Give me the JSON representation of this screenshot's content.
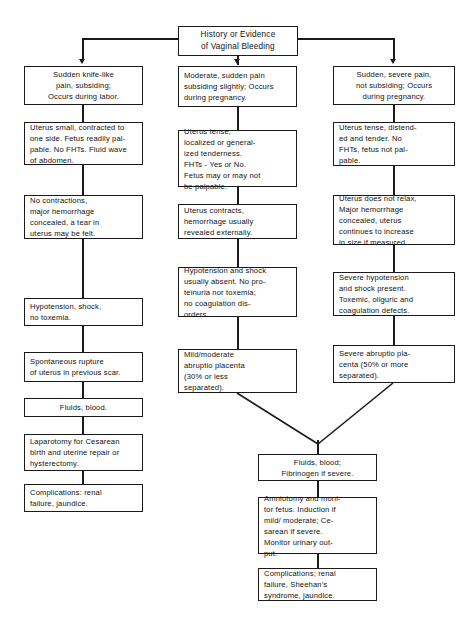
{
  "diagram": {
    "root": {
      "label": "History or Evidence\nof Vaginal Bleeding"
    },
    "columns": [
      {
        "name": "uterine-rupture",
        "nodes": [
          {
            "id": "l1",
            "label": "Sudden knife-like\npain, subsiding;\nOccurs during labor."
          },
          {
            "id": "l2",
            "label": "Uterus small, contracted to\none side. Fetus readily pal-\npable. No FHTs. Fluid wave\nof abdomen."
          },
          {
            "id": "l3",
            "label": "No contractions,\nmajor hemorrhage\nconcealed, a tear in\nuterus may be felt."
          },
          {
            "id": "l4",
            "label": "Hypotension, shock,\nno toxemia."
          },
          {
            "id": "l5",
            "label": "Spontaneous rupture\nof uterus in previous scar."
          },
          {
            "id": "l6",
            "label": "Fluids, blood."
          },
          {
            "id": "l7",
            "label": "Laparotomy for Cesarean\nbirth and uterine repair or\nhysterectomy."
          },
          {
            "id": "l8",
            "label": "Complications: renal\nfailure, jaundice."
          }
        ]
      },
      {
        "name": "mild-moderate-abruptio",
        "nodes": [
          {
            "id": "m1",
            "label": "Moderate, sudden pain\nsubsiding slightly; Occurs\nduring pregnancy."
          },
          {
            "id": "m2",
            "label": "Uterus tense,\nlocalized or general-\nized tenderness.\nFHTs - Yes or No.\nFetus may or may not\nbe palpable."
          },
          {
            "id": "m3",
            "label": "Uterus contracts,\nhemorrhage usually\nrevealed externally."
          },
          {
            "id": "m4",
            "label": "Hypotension and shock\nusually absent. No pro-\nteinuria nor toxemia;\nno coagulation dis-\norders."
          },
          {
            "id": "m5",
            "label": "Mild/moderate\nabruptio placenta\n(30% or less\nseparated)."
          }
        ]
      },
      {
        "name": "severe-abruptio",
        "nodes": [
          {
            "id": "r1",
            "label": "Sudden, severe pain,\nnot subsiding; Occurs\nduring pregnancy."
          },
          {
            "id": "r2",
            "label": "Uterus tense, distend-\ned and tender. No\nFHTs, fetus not pal-\npable."
          },
          {
            "id": "r3",
            "label": "Uterus does not relax,\nMajor hemorrhage\nconcealed, uterus\ncontinues to increase\nin size if measured."
          },
          {
            "id": "r4",
            "label": "Severe hypotension\nand shock present.\nToxemic, oliguric and\ncoagulation defects."
          },
          {
            "id": "r5",
            "label": "Severe abruptio pla-\ncenta (50% or more\nseparated)."
          }
        ]
      }
    ],
    "merged": [
      {
        "id": "b1",
        "label": "Fluids, blood;\nFibrinogen if severe."
      },
      {
        "id": "b2",
        "label": "Amniotomy and moni-\ntor fetus. Induction if\nmild/ moderate; Ce-\nsarean if severe.\nMonitor urinary out-\nput."
      },
      {
        "id": "b3",
        "label": "Complications; renal\nfailure, Sheehan's\nsyndrome, jaundice."
      }
    ]
  },
  "colors": {
    "background": "#ffffff",
    "stroke": "#1a1a1a",
    "text": "#111111"
  }
}
